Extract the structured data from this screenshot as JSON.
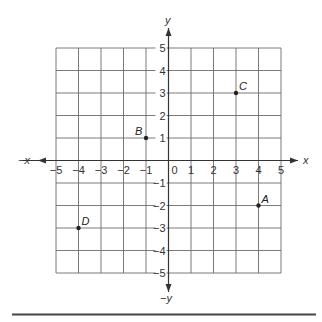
{
  "chart_data": {
    "type": "scatter",
    "title": "",
    "xlabel": "x",
    "ylabel": "y",
    "x_neg_label": "−x",
    "y_neg_label": "−y",
    "xlim": [
      -5,
      5
    ],
    "ylim": [
      -5,
      5
    ],
    "grid": true,
    "x_ticks": [
      "−5",
      "−4",
      "−3",
      "−2",
      "−1",
      "0",
      "1",
      "2",
      "3",
      "4",
      "5"
    ],
    "y_ticks": [
      "5",
      "4",
      "3",
      "2",
      "1",
      "−1",
      "−2",
      "−3",
      "−4",
      "−5"
    ],
    "points": [
      {
        "label": "A",
        "x": 4,
        "y": -2
      },
      {
        "label": "B",
        "x": -1,
        "y": 1
      },
      {
        "label": "C",
        "x": 3,
        "y": 3
      },
      {
        "label": "D",
        "x": -4,
        "y": -3
      }
    ]
  },
  "colors": {
    "grid": "#6b6b6b",
    "axis": "#333333",
    "point": "#222222",
    "rule": "#444444"
  }
}
